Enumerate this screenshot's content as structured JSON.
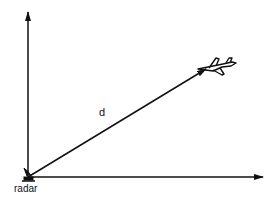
{
  "diagram": {
    "labels": {
      "distance": "d",
      "origin": "radar"
    },
    "colors": {
      "stroke": "#111111",
      "background": "#ffffff"
    },
    "elements": {
      "vertical_axis": "arrow pointing up",
      "horizontal_axis": "arrow pointing right",
      "range_vector": "arrow from radar to airplane",
      "radar_icon": "radar-antenna-icon",
      "target_icon": "airplane-icon"
    }
  }
}
